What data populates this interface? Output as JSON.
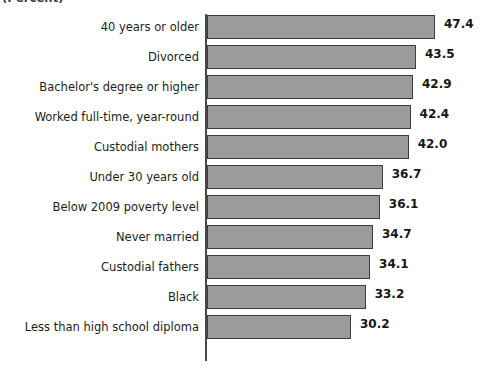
{
  "chart_data": {
    "type": "bar",
    "orientation": "horizontal",
    "title": "",
    "subtitle": "",
    "axis_caption": "(Percent)",
    "axis_caption_note": "partially cut off at top edge of image",
    "xlabel": "",
    "ylabel": "",
    "xlim": [
      0,
      50
    ],
    "grid": true,
    "gridlines": [
      30
    ],
    "legend": null,
    "value_label_format": "one decimal",
    "bar_color": "#9b9b9b",
    "bar_outline_color": "#3c3c3c",
    "axis_color": "#4a4a4a",
    "text_color": "#1d1d1d",
    "categories": [
      "40 years or older",
      "Divorced",
      "Bachelor's degree or higher",
      "Worked full-time, year-round",
      "Custodial mothers",
      "Under 30 years old",
      "Below 2009 poverty level",
      "Never married",
      "Custodial fathers",
      "Black",
      "Less than high school diploma"
    ],
    "values": [
      47.4,
      43.5,
      42.9,
      42.4,
      42.0,
      36.7,
      36.1,
      34.7,
      34.1,
      33.2,
      30.2
    ],
    "value_labels": [
      "47.4",
      "43.5",
      "42.9",
      "42.4",
      "42.0",
      "36.7",
      "36.1",
      "34.7",
      "34.1",
      "33.2",
      "30.2"
    ]
  }
}
